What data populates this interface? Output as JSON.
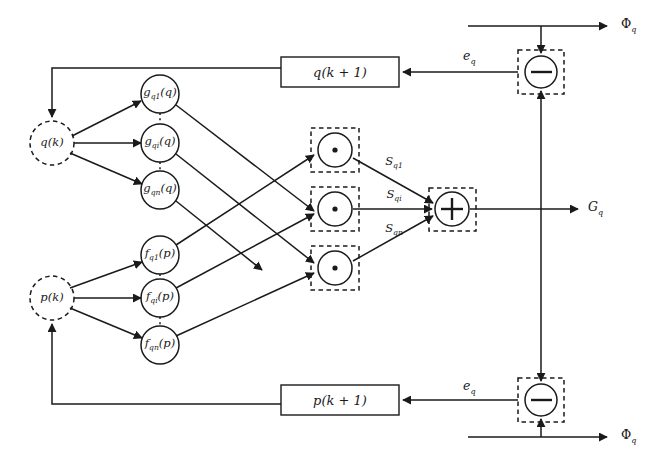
{
  "figure": {
    "background_color": "#ffffff",
    "line_color": "#1a1a1a"
  },
  "inputs": [
    {
      "id": "q-input",
      "label": "q(k)",
      "x": 52,
      "y": 143,
      "style": "dashed-circle",
      "radius": 22
    },
    {
      "id": "p-input",
      "label": "p(k)",
      "x": 52,
      "y": 298,
      "style": "dashed-circle",
      "radius": 22
    }
  ],
  "g_nodes": [
    {
      "id": "g-q1",
      "base": "g",
      "sub": "q1",
      "arg": "(q)",
      "label": "g",
      "subscript": "q1",
      "argument": "(q)",
      "x": 160,
      "y": 94,
      "radius": 19
    },
    {
      "id": "g-qi",
      "base": "g",
      "sub": "qi",
      "arg": "(q)",
      "label": "g",
      "subscript": "qi",
      "argument": "(q)",
      "x": 160,
      "y": 143,
      "radius": 19
    },
    {
      "id": "g-qn",
      "base": "g",
      "sub": "qn",
      "arg": "(q)",
      "label": "g",
      "subscript": "qn",
      "argument": "(q)",
      "x": 160,
      "y": 190,
      "radius": 19
    }
  ],
  "f_nodes": [
    {
      "id": "f-q1",
      "base": "f",
      "sub": "q1",
      "arg": "(p)",
      "label": "f",
      "subscript": "q1",
      "argument": "(p)",
      "x": 160,
      "y": 255,
      "radius": 19
    },
    {
      "id": "f-qi",
      "base": "f",
      "sub": "qi",
      "arg": "(p)",
      "label": "f",
      "subscript": "qi",
      "argument": "(p)",
      "x": 160,
      "y": 298,
      "radius": 19
    },
    {
      "id": "f-qn",
      "base": "f",
      "sub": "qn",
      "arg": "(p)",
      "label": "f",
      "subscript": "qn",
      "argument": "(p)",
      "x": 160,
      "y": 345,
      "radius": 19
    }
  ],
  "product_nodes": [
    {
      "id": "product-1",
      "symbol": "dot",
      "x": 335,
      "y": 150,
      "radius": 17
    },
    {
      "id": "product-i",
      "symbol": "dot",
      "x": 335,
      "y": 209,
      "radius": 17
    },
    {
      "id": "product-n",
      "symbol": "dot",
      "x": 335,
      "y": 268,
      "radius": 17
    }
  ],
  "signal_labels": [
    {
      "id": "s-q1",
      "base": "S",
      "subscript": "q1",
      "x": 394,
      "y": 163
    },
    {
      "id": "s-qi",
      "base": "S",
      "subscript": "qi",
      "x": 394,
      "y": 196
    },
    {
      "id": "s-qn",
      "base": "S",
      "subscript": "qn",
      "x": 394,
      "y": 230
    }
  ],
  "sum_node": {
    "id": "sum-node",
    "symbol": "plus",
    "x": 452,
    "y": 209,
    "radius": 17,
    "output_label": "G",
    "output_subscript": "q",
    "output_x": 588,
    "output_y": 209
  },
  "delay_boxes": [
    {
      "id": "q-next-box",
      "label": "q(k + 1)",
      "x": 340,
      "y": 72,
      "width": 118,
      "height": 30
    },
    {
      "id": "p-next-box",
      "label": "p(k + 1)",
      "x": 340,
      "y": 400,
      "width": 118,
      "height": 30
    }
  ],
  "error_nodes": [
    {
      "id": "error-node-top",
      "symbol": "minus",
      "x": 541,
      "y": 72,
      "radius": 16,
      "error_label": "e",
      "error_subscript": "q",
      "error_x": 463,
      "error_y": 58,
      "phi_label": "Φ",
      "phi_subscript": "q",
      "phi_x": 621,
      "phi_y": 26
    },
    {
      "id": "error-node-bottom",
      "symbol": "minus",
      "x": 541,
      "y": 400,
      "radius": 16,
      "error_label": "e",
      "error_subscript": "q",
      "error_x": 463,
      "error_y": 388,
      "phi_label": "Φ",
      "phi_subscript": "q",
      "phi_x": 621,
      "phi_y": 437
    }
  ]
}
